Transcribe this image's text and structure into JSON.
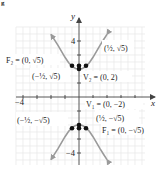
{
  "figure": {
    "corner_mark": "g",
    "axes": {
      "x_label": "x",
      "y_label": "y",
      "x_tick_label": "−4",
      "y_tick_labels": [
        "4",
        "−4"
      ],
      "origin_px": [
        79,
        97
      ],
      "px_per_unit": 14,
      "grid_color": "#e4e4e4",
      "axis_color": "#444444"
    },
    "curve": {
      "equation": "y^2/4 - x^2 = 1",
      "color": "#9a9a9a",
      "x_range": [
        -2,
        2
      ]
    },
    "points": [
      {
        "name": "V2",
        "x": 0,
        "y": 2
      },
      {
        "name": "F2",
        "x": 0,
        "y": 2.236
      },
      {
        "name": "P_upper_left",
        "x": -0.5,
        "y": 2.236
      },
      {
        "name": "P_upper_right",
        "x": 0.5,
        "y": 2.236
      },
      {
        "name": "V1",
        "x": 0,
        "y": -2
      },
      {
        "name": "F1",
        "x": 0,
        "y": -2.236
      },
      {
        "name": "P_lower_left",
        "x": -0.5,
        "y": -2.236
      },
      {
        "name": "P_lower_right",
        "x": 0.5,
        "y": -2.236
      }
    ],
    "labels": {
      "F2": "F₂ = (0, √5)",
      "V2": "V₂ = (0, 2)",
      "upper_left": "(−½, √5)",
      "upper_right": "(½, √5)",
      "V1": "V₁ = (0, −2)",
      "F1": "F₁ = (0, −√5)",
      "lower_left": "(−½, −√5)",
      "lower_right": "(½, −√5)"
    }
  }
}
